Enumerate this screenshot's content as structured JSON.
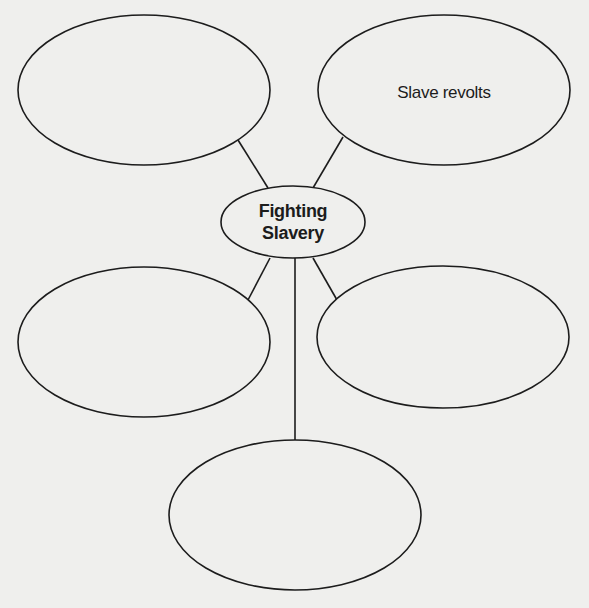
{
  "diagram": {
    "type": "concept-web",
    "center": {
      "line1": "Fighting",
      "line2": "Slavery"
    },
    "nodes": [
      {
        "id": "top-left",
        "label": ""
      },
      {
        "id": "top-right",
        "label": "Slave revolts"
      },
      {
        "id": "middle-left",
        "label": ""
      },
      {
        "id": "middle-right",
        "label": ""
      },
      {
        "id": "bottom",
        "label": ""
      }
    ],
    "colors": {
      "background": "#efefed",
      "stroke": "#1c1c1c",
      "text": "#1c1c1c"
    }
  }
}
